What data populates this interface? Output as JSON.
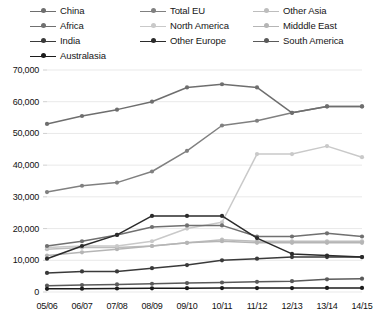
{
  "chart_data": {
    "type": "line",
    "title": "",
    "subtitle": "",
    "xlabel": "",
    "ylabel": "",
    "x": [
      "05/06",
      "06/07",
      "07/08",
      "08/09",
      "09/10",
      "10/11",
      "11/12",
      "12/13",
      "13/14",
      "14/15"
    ],
    "categories": [
      "05/06",
      "06/07",
      "07/08",
      "08/09",
      "09/10",
      "10/11",
      "11/12",
      "12/13",
      "13/14",
      "14/15"
    ],
    "ylim": [
      0,
      70000
    ],
    "ytick_labels": [
      "0",
      "10,000",
      "20,000",
      "30,000",
      "40,000",
      "50,000",
      "60,000",
      "70,000"
    ],
    "ytick_values": [
      0,
      10000,
      20000,
      30000,
      40000,
      50000,
      60000,
      70000
    ],
    "grid": true,
    "grid_axis": "y",
    "legend_position": "top",
    "legend_columns": 3,
    "series": [
      {
        "name": "China",
        "color": "#6e6e6e",
        "values": [
          53000,
          55500,
          57500,
          60000,
          64500,
          65500,
          64500,
          56500,
          58500,
          58500
        ]
      },
      {
        "name": "Total EU",
        "color": "#808080",
        "values": [
          31500,
          33500,
          34500,
          38000,
          44500,
          52500,
          54000,
          56500,
          58500,
          58500
        ]
      },
      {
        "name": "Other Asia",
        "color": "#bdbdbd",
        "values": [
          13500,
          14000,
          14000,
          14500,
          15500,
          16500,
          16000,
          16000,
          16000,
          16000
        ]
      },
      {
        "name": "Africa",
        "color": "#707070",
        "values": [
          14500,
          16000,
          18000,
          20500,
          21000,
          21000,
          17500,
          17500,
          18500,
          17500
        ]
      },
      {
        "name": "North America",
        "color": "#c9c9c9",
        "values": [
          14000,
          14500,
          14500,
          16000,
          20000,
          22000,
          43500,
          43500,
          46000,
          42500
        ]
      },
      {
        "name": "Midddle East",
        "color": "#b5b5b5",
        "values": [
          11500,
          12500,
          13500,
          14500,
          15500,
          16000,
          15500,
          15500,
          15500,
          15500
        ]
      },
      {
        "name": "India",
        "color": "#3a3a3a",
        "values": [
          6000,
          6500,
          6500,
          7500,
          8500,
          10000,
          10500,
          11000,
          11000,
          11000
        ]
      },
      {
        "name": "Other Europe",
        "color": "#2b2b2b",
        "values": [
          10500,
          14500,
          18000,
          24000,
          24000,
          24000,
          17000,
          12000,
          11500,
          11000
        ]
      },
      {
        "name": "South America",
        "color": "#5a5a5a",
        "values": [
          2000,
          2200,
          2400,
          2600,
          2800,
          3000,
          3200,
          3400,
          4000,
          4200
        ]
      },
      {
        "name": "Australasia",
        "color": "#1c1c1c",
        "values": [
          1000,
          1050,
          1100,
          1150,
          1200,
          1250,
          1250,
          1250,
          1300,
          1300
        ]
      }
    ]
  },
  "legend": {
    "items": [
      {
        "label": "China",
        "row": 0,
        "col": 0
      },
      {
        "label": "Total EU",
        "row": 0,
        "col": 1
      },
      {
        "label": "Other Asia",
        "row": 0,
        "col": 2
      },
      {
        "label": "Africa",
        "row": 1,
        "col": 0
      },
      {
        "label": "North America",
        "row": 1,
        "col": 1
      },
      {
        "label": "Midddle East",
        "row": 1,
        "col": 2
      },
      {
        "label": "India",
        "row": 2,
        "col": 0
      },
      {
        "label": "Other Europe",
        "row": 2,
        "col": 1
      },
      {
        "label": "South America",
        "row": 2,
        "col": 2
      },
      {
        "label": "Australasia",
        "row": 3,
        "col": 0
      }
    ]
  },
  "axes": {
    "y_labels": [
      "70,000",
      "60,000",
      "50,000",
      "40,000",
      "30,000",
      "20,000",
      "10,000",
      "0"
    ],
    "x_labels": [
      "05/06",
      "06/07",
      "07/08",
      "08/09",
      "09/10",
      "10/11",
      "11/12",
      "12/13",
      "13/14",
      "14/15"
    ]
  },
  "colors": {
    "grid": "#e9e9e9",
    "axis": "#d0d0d0",
    "text": "#111111",
    "background": "#ffffff"
  }
}
